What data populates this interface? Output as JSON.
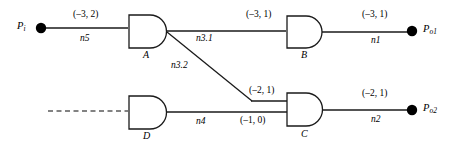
{
  "diagram": {
    "type": "logic-circuit-and-gate-network",
    "ports": {
      "input": {
        "name": "P",
        "subscript": "i"
      },
      "output1": {
        "name": "P",
        "subscript": "o1"
      },
      "output2": {
        "name": "P",
        "subscript": "o2"
      }
    },
    "gates": [
      {
        "id": "A",
        "label": "A",
        "kind": "and-gate"
      },
      {
        "id": "B",
        "label": "B",
        "kind": "and-gate"
      },
      {
        "id": "C",
        "label": "C",
        "kind": "and-gate"
      },
      {
        "id": "D",
        "label": "D",
        "kind": "and-gate"
      }
    ],
    "nets": [
      {
        "id": "n5",
        "label": "n5",
        "weight": "(–3, 2)"
      },
      {
        "id": "n3.1",
        "label": "n3.1",
        "weight": "(–3, 1)"
      },
      {
        "id": "n3.2",
        "label": "n3.2",
        "weight": "(–2, 1)"
      },
      {
        "id": "n1",
        "label": "n1",
        "weight": "(–3, 1)"
      },
      {
        "id": "n4",
        "label": "n4",
        "weight": "(–1, 0)"
      },
      {
        "id": "n2",
        "label": "n2",
        "weight": "(–2, 1)"
      }
    ],
    "colors": {
      "line": "#1a1a1a",
      "text": "#000000",
      "node": "#000000",
      "background": "#ffffff"
    }
  }
}
